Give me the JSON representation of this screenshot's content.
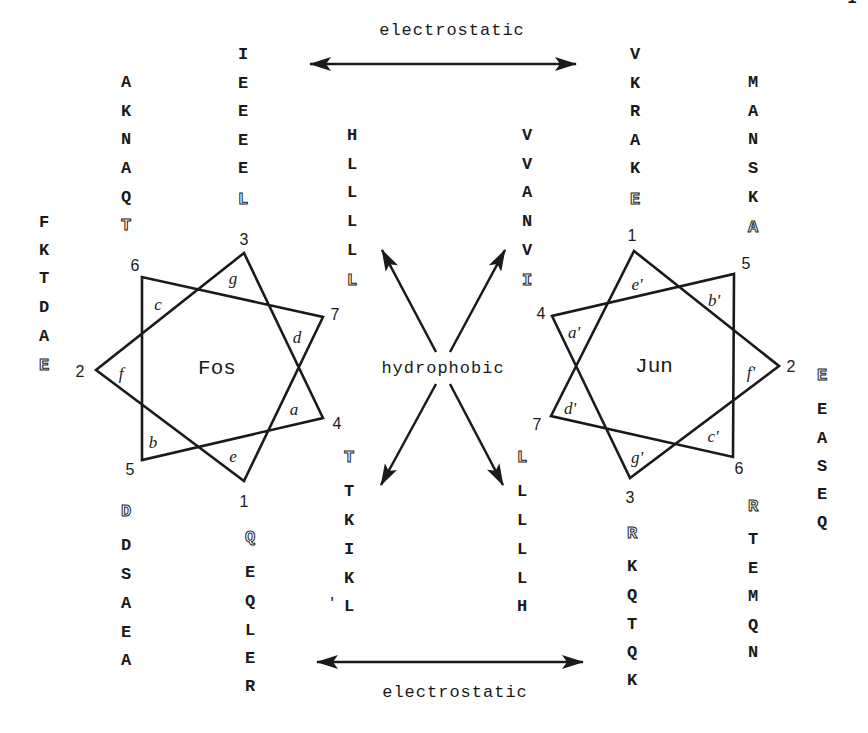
{
  "labels": {
    "electrostatic_top": "electrostatic",
    "electrostatic_bottom": "electrostatic",
    "hydrophobic": "hydrophobic",
    "fos": "Fos",
    "jun": "Jun",
    "page_mark": "1"
  },
  "fos": {
    "vertices": {
      "1": "1",
      "2": "2",
      "3": "3",
      "4": "4",
      "5": "5",
      "6": "6",
      "7": "7"
    },
    "positions": {
      "a": "a",
      "b": "b",
      "c": "c",
      "d": "d",
      "e": "e",
      "f": "f",
      "g": "g"
    },
    "columns": {
      "f_col": [
        "F",
        "K",
        "T",
        "D",
        "A",
        "E"
      ],
      "c_col": [
        "A",
        "K",
        "N",
        "A",
        "Q",
        "T"
      ],
      "g_col": [
        "I",
        "E",
        "E",
        "E",
        "E",
        "L"
      ],
      "d_col": [
        "H",
        "L",
        "L",
        "L",
        "L",
        "L"
      ],
      "b_col": [
        "D",
        "D",
        "S",
        "A",
        "E",
        "A"
      ],
      "e_col": [
        "Q",
        "E",
        "Q",
        "L",
        "E",
        "R"
      ],
      "a_col": [
        "T",
        "T",
        "K",
        "I",
        "K",
        "L"
      ]
    },
    "stray_mark": "'"
  },
  "jun": {
    "vertices": {
      "1": "1",
      "2": "2",
      "3": "3",
      "4": "4",
      "5": "5",
      "6": "6",
      "7": "7"
    },
    "positions": {
      "a": "a'",
      "b": "b'",
      "c": "c'",
      "d": "d'",
      "e": "e'",
      "f": "f'",
      "g": "g'"
    },
    "columns": {
      "a_col": [
        "V",
        "V",
        "A",
        "N",
        "V",
        "I"
      ],
      "e_col": [
        "V",
        "K",
        "R",
        "A",
        "K",
        "E"
      ],
      "b_col": [
        "M",
        "A",
        "N",
        "S",
        "K",
        "A"
      ],
      "f_col": [
        "E",
        "E",
        "A",
        "S",
        "E",
        "Q"
      ],
      "d_col": [
        "L",
        "L",
        "L",
        "L",
        "L",
        "H"
      ],
      "g_col": [
        "R",
        "K",
        "Q",
        "T",
        "Q",
        "K"
      ],
      "c_col": [
        "R",
        "T",
        "E",
        "M",
        "Q",
        "N"
      ]
    }
  }
}
